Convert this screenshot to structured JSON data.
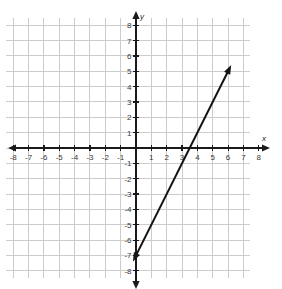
{
  "chart_data": {
    "type": "line",
    "title": "",
    "xlabel": "x",
    "ylabel": "y",
    "xlim": [
      -8.5,
      7.6
    ],
    "ylim": [
      -8.6,
      8.6
    ],
    "grid": true,
    "grid_step": 1,
    "legend": "none",
    "axis_arrows": [
      "left",
      "right",
      "up",
      "down"
    ],
    "x_ticks": [
      -8,
      -7,
      -6,
      -5,
      -4,
      -3,
      -2,
      -1,
      1,
      2,
      3,
      4,
      5,
      6,
      7,
      8
    ],
    "y_ticks": [
      8,
      7,
      6,
      5,
      4,
      3,
      2,
      1,
      -1,
      -2,
      -3,
      -4,
      -5,
      -6,
      -7,
      -8
    ],
    "x_tick_labels": [
      "-8",
      "-7",
      "-6",
      "-5",
      "-4",
      "-3",
      "-2",
      "-1",
      "1",
      "2",
      "3",
      "4",
      "5",
      "6",
      "7",
      "8"
    ],
    "y_tick_labels": [
      "8",
      "7",
      "6",
      "5",
      "4",
      "3",
      "2",
      "1",
      "-1",
      "-2",
      "-3",
      "-4",
      "-5",
      "-6",
      "-7",
      "-8"
    ],
    "series": [
      {
        "name": "line",
        "kind": "straight-line",
        "color": "#141414",
        "arrows": "both",
        "slope": 2,
        "y_intercept": -7,
        "x_intercept": 3.5,
        "endpoints": [
          {
            "x": -0.2,
            "y": -7.4
          },
          {
            "x": 6.2,
            "y": 5.4
          }
        ],
        "points": [
          {
            "x": 0,
            "y": -7
          },
          {
            "x": 3.5,
            "y": 0
          },
          {
            "x": 6,
            "y": 5
          }
        ]
      }
    ],
    "colors": {
      "grid": "#cccccc",
      "axis": "#1a1a1a",
      "line": "#141414",
      "tick_label": "#3a3a3a",
      "background": "#ffffff"
    }
  },
  "axes": {
    "x_label": "x",
    "y_label": "y"
  }
}
